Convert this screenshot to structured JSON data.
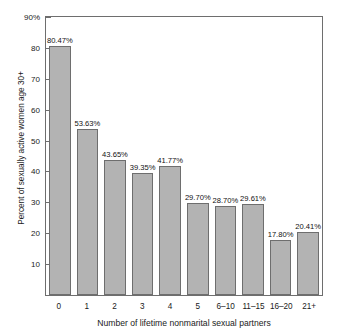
{
  "chart_data": {
    "type": "bar",
    "title": "",
    "xlabel": "Number of lifetime nonmarital sexual partners",
    "ylabel": "Percent of sexually active women age 30+",
    "ylim": [
      0,
      90
    ],
    "grid": false,
    "legend": null,
    "y_ticks": [
      {
        "value": 90,
        "label": "90%"
      },
      {
        "value": 80,
        "label": "80"
      },
      {
        "value": 70,
        "label": "70"
      },
      {
        "value": 60,
        "label": "60"
      },
      {
        "value": 50,
        "label": "50"
      },
      {
        "value": 40,
        "label": "40"
      },
      {
        "value": 30,
        "label": "30"
      },
      {
        "value": 20,
        "label": "20"
      },
      {
        "value": 10,
        "label": "10"
      }
    ],
    "categories": [
      "0",
      "1",
      "2",
      "3",
      "4",
      "5",
      "6–10",
      "11–15",
      "16–20",
      "21+"
    ],
    "values": [
      80.47,
      53.63,
      43.65,
      39.35,
      41.77,
      29.7,
      28.7,
      29.61,
      17.8,
      20.41
    ],
    "data_labels": [
      "80.47%",
      "53.63%",
      "43.65%",
      "39.35%",
      "41.77%",
      "29.70%",
      "28.70%",
      "29.61%",
      "17.80%",
      "20.41%"
    ],
    "colors": {
      "bar_fill": "#b3b3b3",
      "bar_border": "#6e6e6e",
      "axis": "#6e6e6e",
      "text": "#1a1a1a",
      "background": "#ffffff"
    }
  }
}
